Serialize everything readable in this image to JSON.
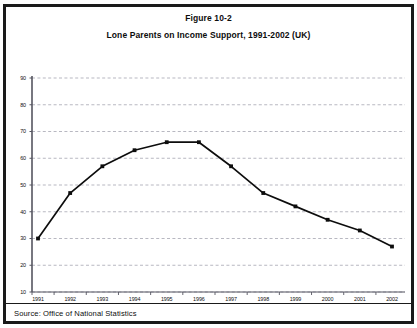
{
  "figure": {
    "number_label": "Figure 10-2",
    "title": "Lone Parents on Income Support, 1991-2002 (UK)",
    "source": "Source: Office of National Statistics"
  },
  "colors": {
    "frame": "#1a1a1a",
    "line": "#0d0d0d",
    "marker": "#0d0d0d",
    "gridline": "#9a9aa6",
    "axis": "#555560",
    "background": "#ffffff"
  },
  "chart_data": {
    "type": "line",
    "title": "Lone Parents on Income Support, 1991-2002 (UK)",
    "subtitle": "Figure 10-2",
    "xlabel": "",
    "ylabel": "",
    "grid": true,
    "legend_position": "none",
    "categories": [
      "1991",
      "1992",
      "1993",
      "1994",
      "1995",
      "1996",
      "1997",
      "1998",
      "1999",
      "2000",
      "2001",
      "2002"
    ],
    "values": [
      30,
      47,
      57,
      63,
      66,
      66,
      57,
      47,
      42,
      37,
      33,
      27
    ],
    "series": [
      {
        "name": "Lone parents on income support",
        "values": [
          30,
          47,
          57,
          63,
          66,
          66,
          57,
          47,
          42,
          37,
          33,
          27
        ]
      }
    ],
    "ylim": [
      10,
      90
    ],
    "ytick_labels": [
      "90",
      "80",
      "70",
      "60",
      "50",
      "40",
      "30",
      "20",
      "10"
    ],
    "ytick_values": [
      90,
      80,
      70,
      60,
      50,
      40,
      30,
      20,
      10
    ],
    "xtick_labels": [
      "1991",
      "1992",
      "1993",
      "1994",
      "1995",
      "1996",
      "1997",
      "1998",
      "1999",
      "2000",
      "2001",
      "2002"
    ],
    "annotations": []
  }
}
